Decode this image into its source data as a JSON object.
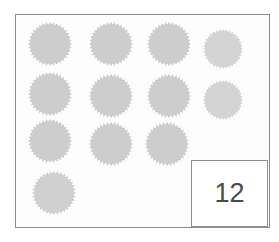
{
  "worksheet": {
    "type": "counting-worksheet",
    "frame": {
      "border_color": "#8c8c8c",
      "background_color": "#fdfdfd"
    },
    "tokens": {
      "icon_name": "starburst-icon",
      "shape": "starburst",
      "total_count": 12,
      "fill_color": "#cfcfcf",
      "points": 36,
      "rows": [
        {
          "row_index": 1,
          "count": 4
        },
        {
          "row_index": 2,
          "count": 4
        },
        {
          "row_index": 3,
          "count": 3
        },
        {
          "row_index": 4,
          "count": 1
        }
      ],
      "items": [
        {
          "id": 1,
          "row": 1,
          "col": 1,
          "cx": 49,
          "cy": 43,
          "r": 22,
          "fill": "#cdcdcd"
        },
        {
          "id": 2,
          "row": 1,
          "col": 2,
          "cx": 110,
          "cy": 43,
          "r": 22,
          "fill": "#cdcdcd"
        },
        {
          "id": 3,
          "row": 1,
          "col": 3,
          "cx": 168,
          "cy": 43,
          "r": 22,
          "fill": "#cdcdcd"
        },
        {
          "id": 4,
          "row": 1,
          "col": 4,
          "cx": 222,
          "cy": 48,
          "r": 20,
          "fill": "#d4d4d4"
        },
        {
          "id": 5,
          "row": 2,
          "col": 1,
          "cx": 49,
          "cy": 93,
          "r": 22,
          "fill": "#cdcdcd"
        },
        {
          "id": 6,
          "row": 2,
          "col": 2,
          "cx": 110,
          "cy": 95,
          "r": 22,
          "fill": "#cdcdcd"
        },
        {
          "id": 7,
          "row": 2,
          "col": 3,
          "cx": 168,
          "cy": 95,
          "r": 22,
          "fill": "#cdcdcd"
        },
        {
          "id": 8,
          "row": 2,
          "col": 4,
          "cx": 222,
          "cy": 99,
          "r": 20,
          "fill": "#d4d4d4"
        },
        {
          "id": 9,
          "row": 3,
          "col": 1,
          "cx": 49,
          "cy": 140,
          "r": 22,
          "fill": "#cdcdcd"
        },
        {
          "id": 10,
          "row": 3,
          "col": 2,
          "cx": 110,
          "cy": 143,
          "r": 22,
          "fill": "#cdcdcd"
        },
        {
          "id": 11,
          "row": 3,
          "col": 3,
          "cx": 166,
          "cy": 143,
          "r": 22,
          "fill": "#cdcdcd"
        },
        {
          "id": 12,
          "row": 4,
          "col": 1,
          "cx": 53,
          "cy": 192,
          "r": 22,
          "fill": "#d0d0d0"
        }
      ]
    },
    "answer_box": {
      "value": "12",
      "border_color": "#8f8f8f",
      "text_color": "#4a4a4a"
    }
  }
}
